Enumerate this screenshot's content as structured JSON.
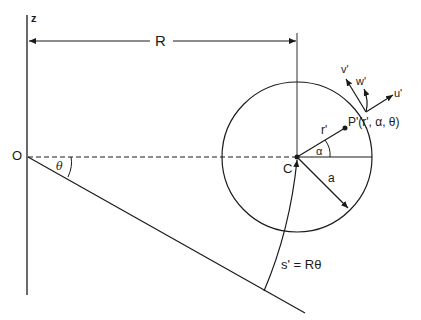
{
  "diagram": {
    "labels": {
      "z_axis": "z",
      "origin": "O",
      "radius_R": "R",
      "theta": "θ",
      "center": "C",
      "alpha": "α",
      "r_prime": "r'",
      "a": "a",
      "point_P": "P'(r', α, θ)",
      "v_prime": "v'",
      "w_prime": "w'",
      "u_prime": "u'",
      "arc_length": "s' = Rθ"
    },
    "colors": {
      "ink": "#1a1a1a",
      "background": "#ffffff"
    }
  }
}
